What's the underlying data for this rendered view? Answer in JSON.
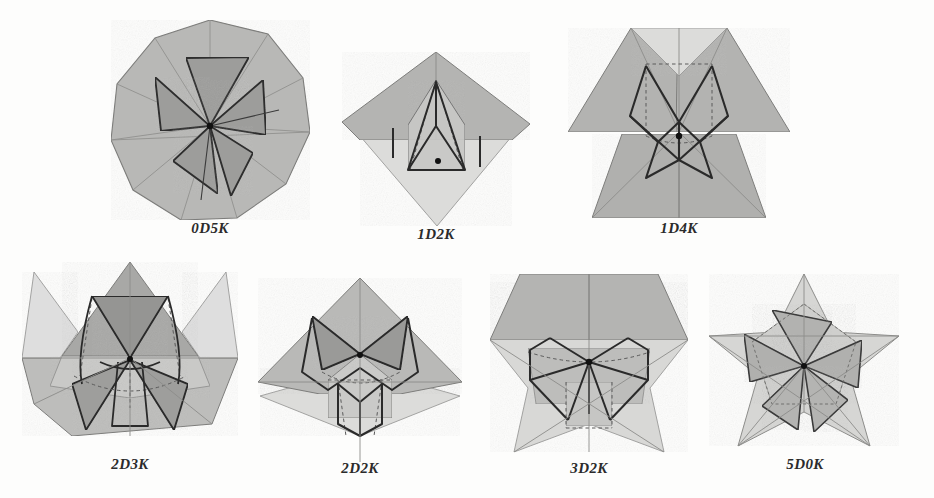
{
  "figure": {
    "background_color": "#fdfdfc",
    "palette": {
      "lightest": "#e3e3e1",
      "light": "#d5d5d3",
      "mid_light": "#c6c6c4",
      "mid": "#b6b6b4",
      "mid_dark": "#a8a8a6",
      "dark": "#9a9a98",
      "darkest": "#8c8c8a",
      "stroke_strong": "#2e2e2e",
      "stroke_thin": "#6e6e6e",
      "dashed": "#5a5a5a",
      "apex_dot": "#111111",
      "label_text": "#2b2b2b"
    },
    "panels": [
      {
        "id": "panel-0d5k",
        "label": "0D5K",
        "row": 1,
        "column": 1,
        "x": 103,
        "y": 14,
        "width": 214,
        "height": 246,
        "shape": "decagon-pinwheel",
        "petal_count": 5,
        "apex_dot": true,
        "label_x_center": 211,
        "label_y": 233
      },
      {
        "id": "panel-1d2k",
        "label": "1D2K",
        "row": 1,
        "column": 2,
        "x": 330,
        "y": 30,
        "width": 212,
        "height": 230,
        "shape": "kite-spike",
        "petal_count": 2,
        "apex_dot": true,
        "label_x_center": 437,
        "label_y": 233
      },
      {
        "id": "panel-1d4k",
        "label": "1D4K",
        "row": 1,
        "column": 3,
        "x": 564,
        "y": 12,
        "width": 230,
        "height": 248,
        "shape": "bowtie-butterfly",
        "petal_count": 4,
        "apex_dot": true,
        "label_x_center": 690,
        "label_y": 233
      },
      {
        "id": "panel-2d3k",
        "label": "2D3K",
        "row": 2,
        "column": 1,
        "x": 14,
        "y": 258,
        "width": 232,
        "height": 218,
        "shape": "crown-three-petal",
        "petal_count": 3,
        "apex_dot": true,
        "label_x_center": 130,
        "label_y": 466
      },
      {
        "id": "panel-2d2k",
        "label": "2D2K",
        "row": 2,
        "column": 2,
        "x": 250,
        "y": 272,
        "width": 220,
        "height": 200,
        "shape": "hourglass-two-petal",
        "petal_count": 2,
        "apex_dot": true,
        "label_x_center": 360,
        "label_y": 466
      },
      {
        "id": "panel-3d2k",
        "label": "3D2K",
        "row": 2,
        "column": 3,
        "x": 482,
        "y": 262,
        "width": 214,
        "height": 208,
        "shape": "star-two-petal",
        "petal_count": 2,
        "apex_dot": true,
        "label_x_center": 589,
        "label_y": 466
      },
      {
        "id": "panel-5d0k",
        "label": "5D0K",
        "row": 2,
        "column": 4,
        "x": 700,
        "y": 270,
        "width": 210,
        "height": 196,
        "shape": "pentagram-pinwheel",
        "petal_count": 5,
        "apex_dot": true,
        "label_x_center": 805,
        "label_y": 466
      }
    ]
  }
}
